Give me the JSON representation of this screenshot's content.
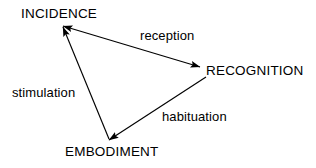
{
  "diagram": {
    "type": "cycle-triangle",
    "background_color": "#ffffff",
    "stroke_color": "#000000",
    "text_color": "#000000",
    "nodes": [
      {
        "id": "incidence",
        "label": "INCIDENCE",
        "x": 63,
        "y": 14
      },
      {
        "id": "recognition",
        "label": "RECOGNITION",
        "x": 258,
        "y": 71
      },
      {
        "id": "embodiment",
        "label": "EMBODIMENT",
        "x": 114,
        "y": 152
      }
    ],
    "edges": [
      {
        "id": "reception",
        "label": "reception",
        "from": "recognition",
        "to": "incidence",
        "arrowheads": "both",
        "x1": 200,
        "y1": 67,
        "x2": 63,
        "y2": 26
      },
      {
        "id": "stimulation",
        "label": "stimulation",
        "from": "embodiment",
        "to": "incidence",
        "arrowheads": "end",
        "x1": 109,
        "y1": 139,
        "x2": 63,
        "y2": 27
      },
      {
        "id": "habituation",
        "label": "habituation",
        "from": "recognition",
        "to": "embodiment",
        "arrowheads": "end",
        "x1": 206,
        "y1": 77,
        "x2": 109,
        "y2": 140
      }
    ]
  }
}
